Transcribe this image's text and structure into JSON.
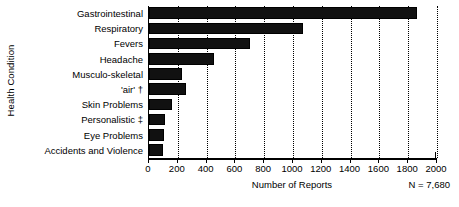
{
  "chart_data": {
    "type": "bar",
    "orientation": "horizontal",
    "title": "",
    "xlabel": "Number of Reports",
    "ylabel": "Health Condition",
    "categories": [
      "Gastrointestinal",
      "Respiratory",
      "Fevers",
      "Headache",
      "Musculo-skeletal",
      "'air' †",
      "Skin Problems",
      "Personalistic ‡",
      "Eye Problems",
      "Accidents and Violence"
    ],
    "values": [
      1860,
      1070,
      700,
      450,
      230,
      260,
      160,
      110,
      105,
      100
    ],
    "xlim": [
      0,
      2000
    ],
    "xticks": [
      0,
      200,
      400,
      600,
      800,
      1000,
      1200,
      1400,
      1600,
      1800,
      2000
    ],
    "xticklabels": [
      "0",
      "200",
      "400",
      "600",
      "800",
      "1000",
      "1200",
      "1400",
      "1600",
      "1800",
      "2000"
    ],
    "grid": "vertical-dotted",
    "legend": "none",
    "bar_color": "#111111",
    "annotation": "N = 7,680"
  }
}
